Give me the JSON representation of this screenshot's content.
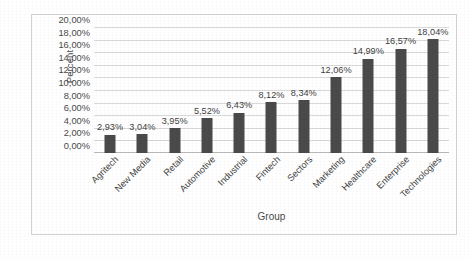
{
  "chart_data": {
    "type": "bar",
    "title": "",
    "xlabel": "Group",
    "ylabel": "Percent",
    "categories": [
      "Agritech",
      "New Media",
      "Retail",
      "Automotive",
      "Industrial",
      "Fintech",
      "Sectors",
      "Marketing",
      "Healthcare",
      "Enterprise",
      "Technologies"
    ],
    "values": [
      2.93,
      3.04,
      3.95,
      5.52,
      6.43,
      8.12,
      8.34,
      12.06,
      14.99,
      16.57,
      18.04
    ],
    "data_labels": [
      "2,93%",
      "3,04%",
      "3,95%",
      "5,52%",
      "6,43%",
      "8,12%",
      "8,34%",
      "12,06%",
      "14,99%",
      "16,57%",
      "18,04%"
    ],
    "ylim": [
      0,
      20
    ],
    "ytick_values": [
      0,
      2,
      4,
      6,
      8,
      10,
      12,
      14,
      16,
      18,
      20
    ],
    "ytick_labels": [
      "0,00%",
      "2,00%",
      "4,00%",
      "6,00%",
      "8,00%",
      "10,00%",
      "12,00%",
      "14,00%",
      "16,00%",
      "18,00%",
      "20,00%"
    ],
    "grid": true,
    "legend": "none",
    "bar_color": "#4a4a4a",
    "gridline_color": "#d9d9d9",
    "plot_background": "#ffffff",
    "border_color": "#d2d2d2"
  }
}
